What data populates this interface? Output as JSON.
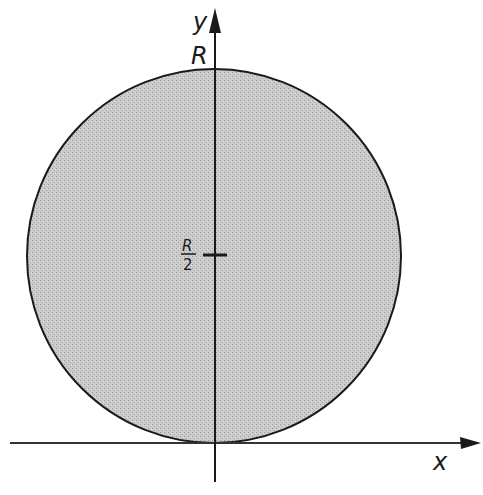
{
  "diagram": {
    "type": "circle-with-axes",
    "axes": {
      "x_label": "x",
      "y_label": "y"
    },
    "circle": {
      "fill": "#c8c8c8",
      "stroke": "#1a1a1a",
      "top_label": "R",
      "mid_label_numerator": "R",
      "mid_label_denominator": "2"
    },
    "colors": {
      "background": "#ffffff",
      "ink": "#1a1a1a",
      "shading": "#c8c8c8"
    }
  }
}
